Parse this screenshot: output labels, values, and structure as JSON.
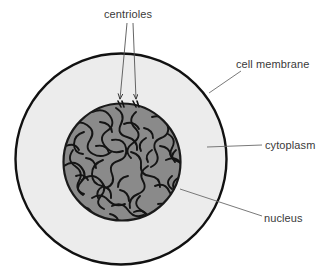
{
  "figure": {
    "background_color": "#ffffff"
  },
  "structures": {
    "cell_membrane": {
      "label": "cell membrane",
      "shape": "circle",
      "center_x": 121,
      "center_y": 159,
      "radius": 106,
      "stroke_color": "#111111",
      "stroke_width": 2.4,
      "fill_color": "#ececec"
    },
    "cytoplasm": {
      "label": "cytoplasm",
      "fill_color": "#ececec",
      "description": "light grey region between cell membrane and nucleus"
    },
    "nucleus": {
      "label": "nucleus",
      "shape": "circle",
      "center_x": 122,
      "center_y": 162,
      "radius": 59,
      "stroke_color": "#1a1a1a",
      "stroke_width": 2.2,
      "fill_color": "#8a8a8a",
      "texture": "dark squiggly chromatin threads"
    },
    "centrioles": {
      "label": "centrioles",
      "count": 2,
      "marker_color": "#1a1a1a",
      "positions": [
        {
          "x": 120,
          "y": 104
        },
        {
          "x": 135,
          "y": 104
        }
      ]
    }
  },
  "leaders": {
    "centrioles": {
      "line_color": "#555555",
      "line_width": 0.8,
      "lines": [
        {
          "x1": 127,
          "y1": 22,
          "x2": 120,
          "y2": 100
        },
        {
          "x1": 133,
          "y1": 22,
          "x2": 136,
          "y2": 100
        }
      ],
      "arrowheads": true
    },
    "cell_membrane": {
      "line_color": "#6a6a6a",
      "line_width": 0.8,
      "x1": 209,
      "y1": 93,
      "x2": 241,
      "y2": 71
    },
    "cytoplasm": {
      "line_color": "#6a6a6a",
      "line_width": 0.8,
      "x1": 207,
      "y1": 147,
      "x2": 262,
      "y2": 145
    },
    "nucleus": {
      "line_color": "#6a6a6a",
      "line_width": 0.8,
      "x1": 180,
      "y1": 189,
      "x2": 262,
      "y2": 216
    }
  },
  "labels": {
    "centrioles": "centrioles",
    "cell_membrane": "cell membrane",
    "cytoplasm": "cytoplasm",
    "nucleus": "nucleus"
  }
}
